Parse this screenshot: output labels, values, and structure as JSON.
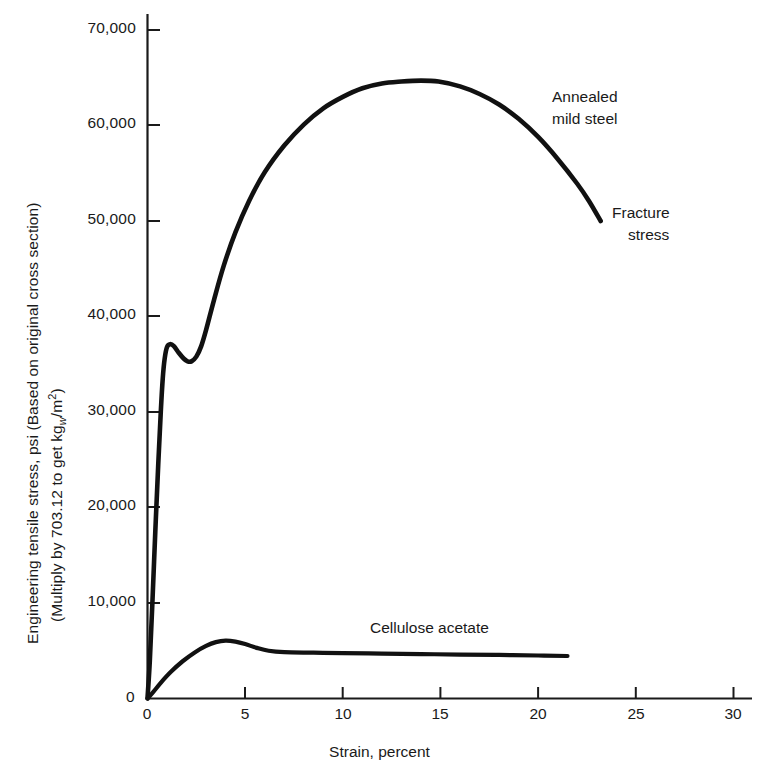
{
  "chart_data": {
    "type": "line",
    "title": "",
    "subtitle": "",
    "xlabel": "Strain, percent",
    "ylabel_line1": "Engineering tensile stress, psi (Based on original cross section)",
    "ylabel_line2_prefix": "(Multiply by 703.12 to get kg",
    "ylabel_line2_sub": "w",
    "ylabel_line2_mid": "/m",
    "ylabel_line2_sup": "2",
    "ylabel_line2_suffix": ")",
    "xlim": [
      0,
      30
    ],
    "ylim": [
      0,
      72000
    ],
    "grid": false,
    "legend_position": "inline-annotations",
    "xticks": [
      0,
      5,
      10,
      15,
      20,
      25,
      30
    ],
    "xticklabels": [
      "0",
      "5",
      "10",
      "15",
      "20",
      "25",
      "30"
    ],
    "yticks": [
      0,
      10000,
      20000,
      30000,
      40000,
      50000,
      60000,
      70000
    ],
    "yticklabels": [
      "0",
      "10,000",
      "20,000",
      "30,000",
      "40,000",
      "50,000",
      "60,000",
      "70,000"
    ],
    "origin_y_label": "0",
    "line_color": "#111111",
    "axis_color": "#1a1a1a",
    "series": [
      {
        "name": "Annealed mild steel",
        "points": [
          [
            0.0,
            0
          ],
          [
            0.12,
            4000
          ],
          [
            0.25,
            10000
          ],
          [
            0.4,
            17500
          ],
          [
            0.55,
            24500
          ],
          [
            0.68,
            30000
          ],
          [
            0.78,
            33500
          ],
          [
            0.88,
            35600
          ],
          [
            1.0,
            36800
          ],
          [
            1.15,
            37100
          ],
          [
            1.35,
            36900
          ],
          [
            1.6,
            36200
          ],
          [
            1.85,
            35600
          ],
          [
            2.05,
            35300
          ],
          [
            2.25,
            35300
          ],
          [
            2.5,
            35800
          ],
          [
            2.75,
            36900
          ],
          [
            3.0,
            38600
          ],
          [
            3.4,
            41700
          ],
          [
            3.9,
            45300
          ],
          [
            4.5,
            48800
          ],
          [
            5.2,
            52100
          ],
          [
            6.0,
            55100
          ],
          [
            7.0,
            57900
          ],
          [
            8.0,
            60100
          ],
          [
            9.0,
            61800
          ],
          [
            10.0,
            63000
          ],
          [
            11.0,
            63900
          ],
          [
            12.0,
            64400
          ],
          [
            13.0,
            64600
          ],
          [
            14.0,
            64700
          ],
          [
            14.9,
            64600
          ],
          [
            16.0,
            64100
          ],
          [
            17.0,
            63300
          ],
          [
            18.0,
            62200
          ],
          [
            19.0,
            60700
          ],
          [
            20.0,
            58800
          ],
          [
            21.0,
            56500
          ],
          [
            22.0,
            53900
          ],
          [
            22.6,
            52100
          ],
          [
            23.2,
            50000
          ]
        ],
        "annotations": [
          {
            "label_line1": "Annealed",
            "label_line2": "mild steel",
            "at": [
              19.0,
              61500
            ]
          },
          {
            "label_line1": "Fracture",
            "label_line2": "stress",
            "at": [
              23.8,
              50000
            ]
          }
        ]
      },
      {
        "name": "Cellulose acetate",
        "points": [
          [
            0.0,
            0
          ],
          [
            0.3,
            700
          ],
          [
            0.7,
            1700
          ],
          [
            1.2,
            2800
          ],
          [
            1.8,
            3900
          ],
          [
            2.4,
            4800
          ],
          [
            3.0,
            5500
          ],
          [
            3.5,
            5900
          ],
          [
            4.0,
            6050
          ],
          [
            4.5,
            5950
          ],
          [
            5.0,
            5700
          ],
          [
            5.6,
            5300
          ],
          [
            6.2,
            5000
          ],
          [
            7.0,
            4850
          ],
          [
            8.5,
            4800
          ],
          [
            10.0,
            4750
          ],
          [
            12.0,
            4700
          ],
          [
            14.0,
            4650
          ],
          [
            16.0,
            4600
          ],
          [
            18.0,
            4560
          ],
          [
            20.0,
            4500
          ],
          [
            21.5,
            4450
          ]
        ],
        "annotations": [
          {
            "label_line1": "Cellulose acetate",
            "at": [
              11.5,
              8800
            ]
          }
        ]
      }
    ]
  },
  "annotations": {
    "steel_line1": "Annealed",
    "steel_line2": "mild steel",
    "fracture_line1": "Fracture",
    "fracture_line2": "stress",
    "cellulose": "Cellulose acetate"
  },
  "axes": {
    "xlabel": "Strain, percent",
    "y_origin_label": "0",
    "y_ticks": [
      "10,000",
      "20,000",
      "30,000",
      "40,000",
      "50,000",
      "60,000",
      "70,000"
    ],
    "x_ticks": [
      "0",
      "5",
      "10",
      "15",
      "20",
      "25",
      "30"
    ]
  },
  "ylabel": {
    "line1": "Engineering tensile stress, psi (Based on original cross section)",
    "line2_a": "(Multiply by 703.12 to get kg",
    "line2_sub": "w",
    "line2_b": "/m",
    "line2_sup": "2",
    "line2_c": ")"
  }
}
